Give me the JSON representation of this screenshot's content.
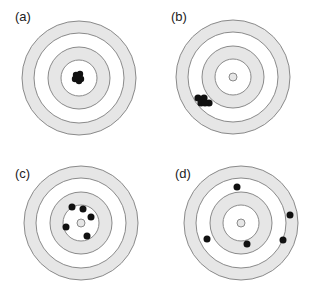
{
  "figure": {
    "colors": {
      "band": "#e6e6e6",
      "ring_stroke": "#8a8a8a",
      "shot": "#111111",
      "background": "#ffffff"
    },
    "ring_radii": [
      57,
      45,
      31,
      18
    ],
    "bullseye_radius": 4,
    "panels": [
      {
        "label": "(a)",
        "label_pos": [
          15,
          21
        ],
        "center": [
          79,
          78
        ],
        "bullseye": false,
        "shots": [
          [
            76,
            75
          ],
          [
            80,
            74
          ],
          [
            78,
            78
          ],
          [
            75,
            79
          ],
          [
            81,
            79
          ],
          [
            79,
            81
          ],
          [
            77,
            76
          ]
        ],
        "shot_radius": 3.2
      },
      {
        "label": "(b)",
        "label_pos": [
          171,
          21
        ],
        "center": [
          233,
          77
        ],
        "bullseye": true,
        "shots": [
          [
            198,
            98
          ],
          [
            204,
            98
          ],
          [
            201,
            103
          ],
          [
            209,
            103
          ],
          [
            205,
            103
          ]
        ],
        "shot_radius": 3.6
      },
      {
        "label": "(c)",
        "label_pos": [
          15,
          178
        ],
        "center": [
          81,
          223
        ],
        "bullseye": true,
        "shots": [
          [
            72,
            207
          ],
          [
            83,
            209
          ],
          [
            91,
            217
          ],
          [
            66,
            227
          ],
          [
            87,
            236
          ]
        ],
        "shot_radius": 3.5
      },
      {
        "label": "(d)",
        "label_pos": [
          175,
          178
        ],
        "center": [
          241,
          223
        ],
        "bullseye": true,
        "shots": [
          [
            237,
            187
          ],
          [
            290,
            215
          ],
          [
            283,
            240
          ],
          [
            207,
            239
          ],
          [
            247,
            244
          ]
        ],
        "shot_radius": 3.5
      }
    ]
  }
}
